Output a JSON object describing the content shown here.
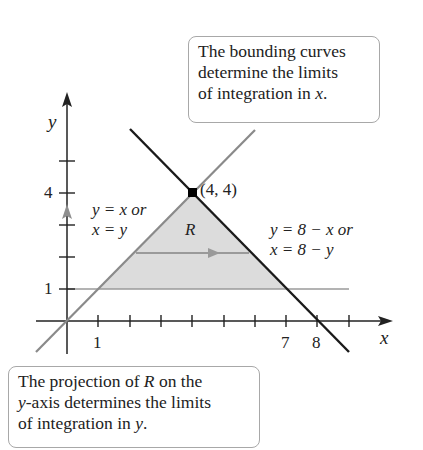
{
  "callouts": {
    "top": {
      "line1": "The bounding curves",
      "line2": "determine the limits",
      "line3_prefix": "of integration in ",
      "line3_var": "x",
      "line3_suffix": "."
    },
    "bottom": {
      "line1_prefix": "The projection of ",
      "line1_var": "R",
      "line1_suffix": " on the",
      "line2_var": "y",
      "line2_suffix": "-axis determines the limits",
      "line3_prefix": "of integration in ",
      "line3_var": "y",
      "line3_suffix": "."
    }
  },
  "axes": {
    "x_label": "x",
    "y_label": "y",
    "x_ticks_labeled": [
      "1",
      "7",
      "8"
    ],
    "y_ticks_labeled": [
      "1",
      "4"
    ]
  },
  "curves": {
    "left": {
      "eq1": "y = x or",
      "eq2": "x = y"
    },
    "right": {
      "eq1": "y = 8 − x or",
      "eq2": "x = 8 − y"
    }
  },
  "region_label": "R",
  "point_label": "(4, 4)",
  "colors": {
    "shade": "#dcdcdc",
    "gray_line": "#8a8a8a",
    "black_line": "#1a1a1a",
    "border": "#a8a8a8"
  }
}
